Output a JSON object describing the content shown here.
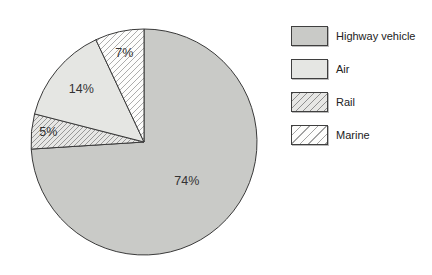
{
  "chart_data": {
    "type": "pie",
    "title": "",
    "slices": [
      {
        "label": "Highway vehicle",
        "value": 74,
        "display": "74%",
        "style": "solid-gray"
      },
      {
        "label": "Rail",
        "value": 5,
        "display": "5%",
        "style": "hatch-gray"
      },
      {
        "label": "Air",
        "value": 14,
        "display": "14%",
        "style": "solid-light"
      },
      {
        "label": "Marine",
        "value": 7,
        "display": "7%",
        "style": "hatch-white"
      }
    ],
    "start_angle_deg": 0,
    "direction": "clockwise",
    "legend_position": "right",
    "colors": {
      "solid-gray": "#c9cac7",
      "solid-light": "#e5e6e3",
      "hatch-gray-bg": "#e7e7e5",
      "hatch-white-bg": "#fdfdfc",
      "hatch-line": "#8f8f8f",
      "outline": "#3a3a3a",
      "label-text": "#333333"
    },
    "center": {
      "x": 144,
      "y": 142
    },
    "radius": 113,
    "label_radius_frac": [
      0.52,
      0.85,
      0.72,
      0.8
    ]
  },
  "legend": {
    "items": [
      {
        "label": "Highway vehicle",
        "style": "solid-gray"
      },
      {
        "label": "Air",
        "style": "solid-light"
      },
      {
        "label": "Rail",
        "style": "hatch-gray"
      },
      {
        "label": "Marine",
        "style": "hatch-white"
      }
    ]
  }
}
